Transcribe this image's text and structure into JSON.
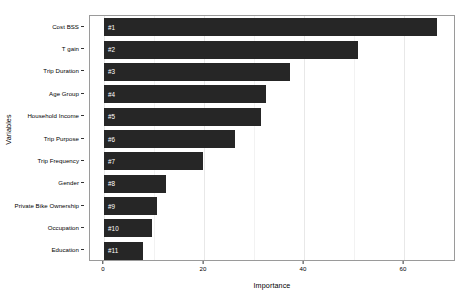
{
  "chart_data": {
    "type": "bar",
    "orientation": "horizontal",
    "title": "",
    "xlabel": "Importance",
    "ylabel": "Variables",
    "xlim": [
      0,
      68.5
    ],
    "ylim": null,
    "grid": true,
    "legend": null,
    "bar_color": "#262626",
    "panel_border_color": "#9a9a9a",
    "gridline_color": "#e8e8e8",
    "x_ticks": [
      {
        "value": 0,
        "label": "0"
      },
      {
        "value": 20,
        "label": "20"
      },
      {
        "value": 40,
        "label": "40"
      },
      {
        "value": 60,
        "label": "60"
      }
    ],
    "x_minor_ticks": [
      10,
      30,
      50
    ],
    "categories": [
      "Cost BSS",
      "T gain",
      "Trip Duration",
      "Age Group",
      "Household Income",
      "Trip Purpose",
      "Trip Frequency",
      "Gender",
      "Private Bike Ownership",
      "Occupation",
      "Education"
    ],
    "values": [
      66.6,
      50.8,
      37.2,
      32.4,
      31.4,
      26.2,
      19.8,
      12.4,
      10.6,
      9.6,
      7.8
    ],
    "annotations": [
      "#1",
      "#2",
      "#3",
      "#4",
      "#5",
      "#6",
      "#7",
      "#8",
      "#9",
      "#10",
      "#11"
    ]
  }
}
